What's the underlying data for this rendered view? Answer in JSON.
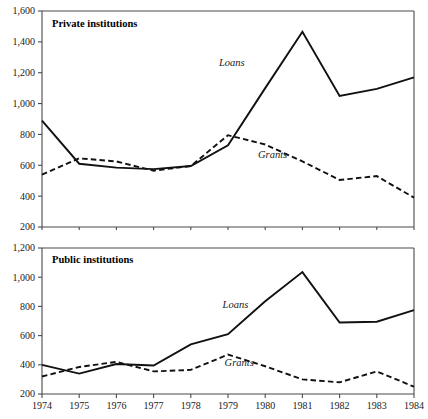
{
  "figure": {
    "width": 428,
    "height": 419,
    "background": "#ffffff",
    "line_color": "#111111",
    "axis_color": "#4a4a4a"
  },
  "chart_data": [
    {
      "type": "line",
      "title": "Private institutions",
      "xlabel": "",
      "ylabel": "",
      "grid": false,
      "legend": "inline-annotations",
      "x": [
        1974,
        1975,
        1976,
        1977,
        1978,
        1979,
        1980,
        1981,
        1982,
        1983,
        1984
      ],
      "xticklabels": [
        "1974",
        "1975",
        "1976",
        "1977",
        "1978",
        "1979",
        "1980",
        "1981",
        "1982",
        "1983",
        "1984"
      ],
      "xlim": [
        1974,
        1984
      ],
      "ylim": [
        200,
        1600
      ],
      "yticks": [
        200,
        400,
        600,
        800,
        1000,
        1200,
        1400,
        1600
      ],
      "yticklabels": [
        "200",
        "400",
        "600",
        "800",
        "1,000",
        "1,200",
        "1,400",
        "1,600"
      ],
      "series": [
        {
          "name": "Loans",
          "style": "solid",
          "label_x": 1979.1,
          "label_y": 1245,
          "values": [
            890,
            610,
            585,
            575,
            595,
            730,
            1100,
            1465,
            1050,
            1095,
            1170
          ]
        },
        {
          "name": "Grants",
          "style": "dashed",
          "label_x": 1980.2,
          "label_y": 645,
          "values": [
            540,
            645,
            625,
            565,
            595,
            795,
            735,
            625,
            505,
            530,
            390
          ]
        }
      ]
    },
    {
      "type": "line",
      "title": "Public institutions",
      "xlabel": "",
      "ylabel": "",
      "grid": false,
      "legend": "inline-annotations",
      "x": [
        1974,
        1975,
        1976,
        1977,
        1978,
        1979,
        1980,
        1981,
        1982,
        1983,
        1984
      ],
      "xticklabels": [
        "1974",
        "1975",
        "1976",
        "1977",
        "1978",
        "1979",
        "1980",
        "1981",
        "1982",
        "1983",
        "1984"
      ],
      "xlim": [
        1974,
        1984
      ],
      "ylim": [
        200,
        1200
      ],
      "yticks": [
        200,
        400,
        600,
        800,
        1000,
        1200
      ],
      "yticklabels": [
        "200",
        "400",
        "600",
        "800",
        "1,000",
        "1,200"
      ],
      "series": [
        {
          "name": "Loans",
          "style": "solid",
          "label_x": 1979.2,
          "label_y": 790,
          "values": [
            400,
            340,
            405,
            395,
            540,
            610,
            835,
            1035,
            690,
            695,
            775
          ]
        },
        {
          "name": "Grants",
          "style": "dashed",
          "label_x": 1979.3,
          "label_y": 395,
          "values": [
            320,
            385,
            420,
            355,
            365,
            470,
            390,
            300,
            280,
            355,
            250
          ]
        }
      ]
    }
  ],
  "axes_labels": {
    "top_y": [
      "1,600",
      "1,400",
      "1,200",
      "1,000",
      "800",
      "600",
      "400",
      "200"
    ],
    "bottom_y": [
      "1,200",
      "1,000",
      "800",
      "600",
      "400",
      "200"
    ],
    "x": [
      "1974",
      "1975",
      "1976",
      "1977",
      "1978",
      "1979",
      "1980",
      "1981",
      "1982",
      "1983",
      "1984"
    ]
  }
}
